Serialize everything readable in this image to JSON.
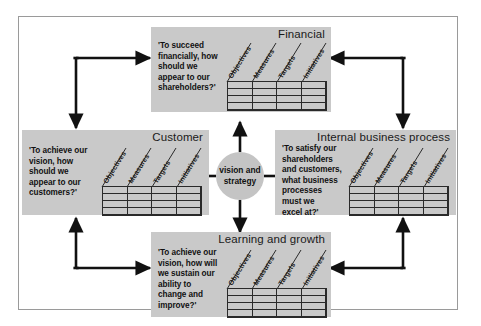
{
  "diagram": {
    "center": {
      "label": "vision and\nstrategy",
      "name": "vision-and-strategy-hub"
    },
    "column_headers": [
      "Objectives",
      "Measures",
      "Targets",
      "Initiatives"
    ],
    "grid": {
      "columns": 4,
      "rows": 4,
      "cells_empty": true
    },
    "perspectives": [
      {
        "id": "financial",
        "title": "Financial",
        "quote": "'To succeed\nfinancially, how\nshould we\nappear to our\nshareholders?'",
        "headers": [
          "Objectives",
          "Measures",
          "Targets",
          "Initiatives"
        ]
      },
      {
        "id": "customer",
        "title": "Customer",
        "quote": "'To achieve our\nvision, how\nshould we\nappear to our\ncustomers?'",
        "headers": [
          "Objectives",
          "Measures",
          "Targets",
          "Initiatives"
        ]
      },
      {
        "id": "internal-business-process",
        "title": "Internal business process",
        "quote": "'To satisfy our\nshareholders\nand customers,\nwhat business\nprocesses\nmust we\nexcel at?'",
        "headers": [
          "Objectives",
          "Measures",
          "Targets",
          "Initiatives"
        ]
      },
      {
        "id": "learning-and-growth",
        "title": "Learning and growth",
        "quote": "'To achieve our\nvision, how will\nwe sustain our\nability to\nchange and\nimprove?'",
        "headers": [
          "Objectives",
          "Measures",
          "Targets",
          "Initiatives"
        ]
      }
    ],
    "colors": {
      "panel_fill": "#c9c9c9",
      "hub_fill": "#c4c4c4",
      "arrow": "#111111",
      "grid_line": "#2a2a2a",
      "frame_border": "#9a9a9a",
      "page_background": "#ffffff",
      "text": "#111111"
    }
  }
}
